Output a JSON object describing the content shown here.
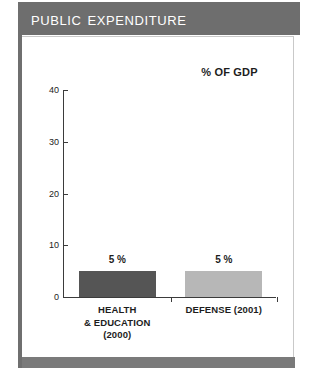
{
  "header": {
    "title": "Public expenditure"
  },
  "chart_data": {
    "type": "bar",
    "title": "Public expenditure",
    "subtitle": "% OF GDP",
    "xlabel": "",
    "ylabel": "% OF GDP",
    "ylim": [
      0,
      40
    ],
    "yticks": [
      0,
      10,
      20,
      30,
      40
    ],
    "ytick_labels": [
      "0",
      "10",
      "20",
      "30",
      "40"
    ],
    "grid": false,
    "legend": "none",
    "categories": [
      "HEALTH & EDUCATION (2000)",
      "DEFENSE (2001)"
    ],
    "category_lines": [
      [
        "HEALTH",
        "& EDUCATION",
        "(2000)"
      ],
      [
        "DEFENSE (2001)"
      ]
    ],
    "values": [
      5,
      5
    ],
    "data_labels": [
      "5 %",
      "5 %"
    ],
    "bar_colors": [
      "#555555",
      "#b7b7b7"
    ]
  },
  "colors": {
    "title_bar": "#6e6e6e",
    "bottom_bar": "#7a7a7a",
    "spine": "#6f6f6f",
    "axis": "#3b3b3b",
    "text": "#1d1d1d",
    "panel_background": "#ffffff"
  }
}
